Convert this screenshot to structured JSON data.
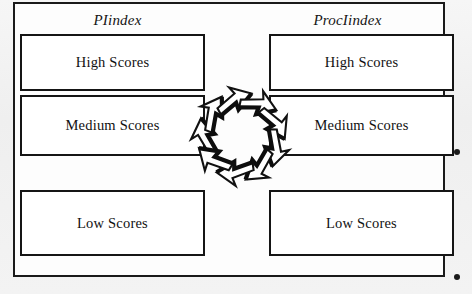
{
  "figure": {
    "type": "diagram",
    "background_color": "#f1f1f1",
    "frame_color": "#1a1a1a",
    "box_fill": "#ffffff"
  },
  "columns": [
    {
      "id": "left",
      "header": "PIindex",
      "boxes": [
        {
          "id": "high",
          "label": "High Scores"
        },
        {
          "id": "medium",
          "label": "Medium Scores"
        },
        {
          "id": "low",
          "label": "Low Scores"
        }
      ]
    },
    {
      "id": "right",
      "header": "ProcIindex",
      "boxes": [
        {
          "id": "high",
          "label": "High Scores"
        },
        {
          "id": "medium",
          "label": "Medium Scores"
        },
        {
          "id": "low",
          "label": "Low Scores"
        }
      ]
    }
  ],
  "cycle_graphic": {
    "name": "circular-arrows",
    "arrow_count": 9,
    "direction": "clockwise",
    "fill": "#ffffff",
    "stroke": "#111111"
  },
  "margin_marks": [
    {
      "id": "dot-1",
      "shape": "dot",
      "color": "#1b1b1b"
    },
    {
      "id": "dot-2",
      "shape": "dot",
      "color": "#1b1b1b"
    }
  ]
}
